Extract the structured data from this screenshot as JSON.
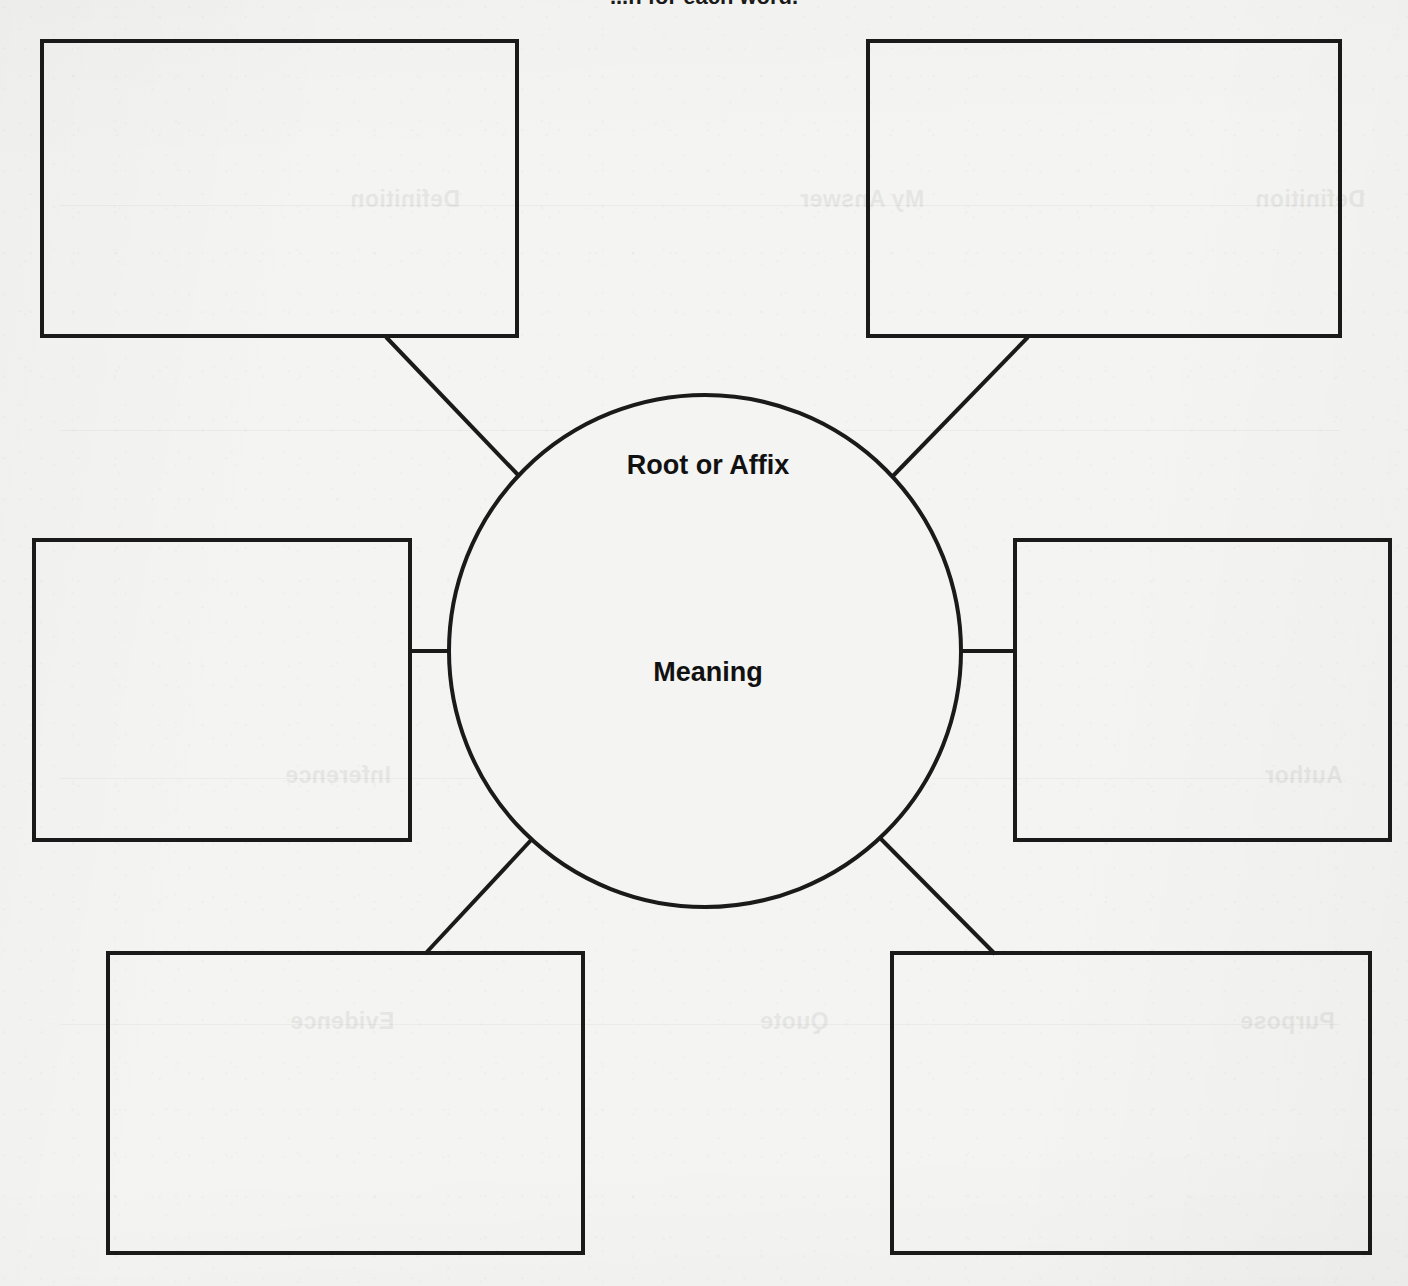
{
  "document": {
    "title": "Word Web Graphic Organizer",
    "heading": "...n for each word.",
    "heading_truncated": true,
    "page_background": "#f4f4f2",
    "ink_color": "#1a1a1a"
  },
  "organizer": {
    "type": "word-web",
    "center": {
      "shape": "circle",
      "labels": [
        {
          "id": "root-or-affix",
          "text": "Root or Affix"
        },
        {
          "id": "meaning",
          "text": "Meaning"
        }
      ],
      "cx": 705,
      "cy": 651,
      "r": 256
    },
    "boxes": [
      {
        "id": "box-top-left",
        "position": "top-left",
        "value": "",
        "x": 42,
        "y": 41,
        "w": 475,
        "h": 295
      },
      {
        "id": "box-top-right",
        "position": "top-right",
        "value": "",
        "x": 868,
        "y": 41,
        "w": 472,
        "h": 295
      },
      {
        "id": "box-middle-left",
        "position": "middle-left",
        "value": "",
        "x": 34,
        "y": 540,
        "w": 376,
        "h": 300
      },
      {
        "id": "box-middle-right",
        "position": "middle-right",
        "value": "",
        "x": 1015,
        "y": 540,
        "w": 375,
        "h": 300
      },
      {
        "id": "box-bottom-left",
        "position": "bottom-left",
        "value": "",
        "x": 108,
        "y": 953,
        "w": 475,
        "h": 300
      },
      {
        "id": "box-bottom-right",
        "position": "bottom-right",
        "value": "",
        "x": 892,
        "y": 953,
        "w": 478,
        "h": 300
      }
    ],
    "connectors": [
      {
        "id": "connector-top-left",
        "from": "box-top-left",
        "to": "center",
        "x1": 386,
        "y1": 337,
        "x2": 520,
        "y2": 477
      },
      {
        "id": "connector-top-right",
        "from": "box-top-right",
        "to": "center",
        "x1": 1028,
        "y1": 337,
        "x2": 891,
        "y2": 478
      },
      {
        "id": "connector-middle-left",
        "from": "box-middle-left",
        "to": "center",
        "x1": 410,
        "y1": 651,
        "x2": 450,
        "y2": 651
      },
      {
        "id": "connector-middle-right",
        "from": "box-middle-right",
        "to": "center",
        "x1": 961,
        "y1": 651,
        "x2": 1015,
        "y2": 651
      },
      {
        "id": "connector-bottom-left",
        "from": "box-bottom-left",
        "to": "center",
        "x1": 425,
        "y1": 954,
        "x2": 533,
        "y2": 838
      },
      {
        "id": "connector-bottom-right",
        "from": "box-bottom-right",
        "to": "center",
        "x1": 995,
        "y1": 954,
        "x2": 880,
        "y2": 838
      }
    ]
  },
  "bleed_through": [
    {
      "id": "bleed-1",
      "text": "Definition",
      "x": 350,
      "y": 186
    },
    {
      "id": "bleed-2",
      "text": "My Answer",
      "x": 800,
      "y": 186
    },
    {
      "id": "bleed-3",
      "text": "Definition",
      "x": 1255,
      "y": 186
    },
    {
      "id": "bleed-4",
      "text": "Example",
      "x": 745,
      "y": 523
    },
    {
      "id": "bleed-5",
      "text": "Inference",
      "x": 285,
      "y": 762
    },
    {
      "id": "bleed-6",
      "text": "Evidence",
      "x": 745,
      "y": 762
    },
    {
      "id": "bleed-7",
      "text": "Author",
      "x": 1265,
      "y": 762
    },
    {
      "id": "bleed-8",
      "text": "Evidence",
      "x": 290,
      "y": 1008
    },
    {
      "id": "bleed-9",
      "text": "Quote",
      "x": 760,
      "y": 1008
    },
    {
      "id": "bleed-10",
      "text": "Purpose",
      "x": 1240,
      "y": 1008
    }
  ]
}
